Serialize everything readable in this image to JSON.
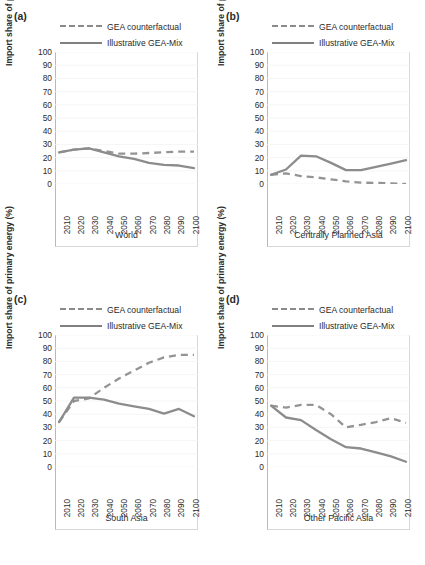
{
  "figure": {
    "ylabel": "Import share of primary energy (%)",
    "legend": {
      "counterfactual": "GEA counterfactual",
      "geamix": "Illustrative GEA-Mix"
    },
    "yticks": [
      "100",
      "90",
      "80",
      "70",
      "60",
      "50",
      "40",
      "30",
      "20",
      "10",
      "0"
    ],
    "xticks": [
      "2010",
      "2020",
      "2030",
      "2040",
      "2050",
      "2060",
      "2070",
      "2080",
      "2090",
      "2100"
    ]
  },
  "panels": [
    {
      "letter": "(a)",
      "caption": "World"
    },
    {
      "letter": "(b)",
      "caption": "Centrally Planned Asia"
    },
    {
      "letter": "(c)",
      "caption": "South Asia"
    },
    {
      "letter": "(d)",
      "caption": "Other Pacific Asia"
    }
  ],
  "chart_data": [
    {
      "type": "line",
      "title": "World",
      "panel": "(a)",
      "xlabel": "",
      "ylabel": "Import share of primary energy (%)",
      "x": [
        2010,
        2020,
        2030,
        2040,
        2050,
        2060,
        2070,
        2080,
        2090,
        2100
      ],
      "xlim": [
        2010,
        2100
      ],
      "ylim": [
        0,
        100
      ],
      "grid": true,
      "legend_position": "top",
      "series": [
        {
          "name": "GEA counterfactual",
          "style": "dashed",
          "color": "#949494",
          "values": [
            24,
            26,
            27,
            25,
            23,
            23,
            23.5,
            24,
            24.5,
            24.5
          ]
        },
        {
          "name": "Illustrative GEA-Mix",
          "style": "solid",
          "color": "#8c8c8c",
          "values": [
            24,
            26,
            27,
            24,
            21,
            19,
            16,
            14.5,
            14,
            12
          ]
        }
      ]
    },
    {
      "type": "line",
      "title": "Centrally Planned Asia",
      "panel": "(b)",
      "xlabel": "",
      "ylabel": "Import share of primary energy (%)",
      "x": [
        2010,
        2020,
        2030,
        2040,
        2050,
        2060,
        2070,
        2080,
        2090,
        2100
      ],
      "xlim": [
        2010,
        2100
      ],
      "ylim": [
        0,
        100
      ],
      "grid": true,
      "legend_position": "top",
      "series": [
        {
          "name": "GEA counterfactual",
          "style": "dashed",
          "color": "#949494",
          "values": [
            7,
            8,
            6,
            5,
            3.5,
            2,
            1,
            0.8,
            0.5,
            0
          ]
        },
        {
          "name": "Illustrative GEA-Mix",
          "style": "solid",
          "color": "#8c8c8c",
          "values": [
            7,
            11,
            21.5,
            21,
            16,
            10.5,
            10.5,
            13,
            15.5,
            18
          ]
        }
      ]
    },
    {
      "type": "line",
      "title": "South Asia",
      "panel": "(c)",
      "xlabel": "",
      "ylabel": "Import share of primary energy (%)",
      "x": [
        2010,
        2020,
        2030,
        2040,
        2050,
        2060,
        2070,
        2080,
        2090,
        2100
      ],
      "xlim": [
        2010,
        2100
      ],
      "ylim": [
        0,
        100
      ],
      "grid": true,
      "legend_position": "top",
      "series": [
        {
          "name": "GEA counterfactual",
          "style": "dashed",
          "color": "#949494",
          "values": [
            34,
            50,
            52,
            60,
            67,
            73,
            79,
            83,
            85,
            85
          ]
        },
        {
          "name": "Illustrative GEA-Mix",
          "style": "solid",
          "color": "#8c8c8c",
          "values": [
            34,
            52.5,
            52.5,
            51,
            48,
            46,
            44,
            40.5,
            44,
            38.5
          ]
        }
      ]
    },
    {
      "type": "line",
      "title": "Other Pacific Asia",
      "panel": "(d)",
      "xlabel": "",
      "ylabel": "Import share of primary energy (%)",
      "x": [
        2010,
        2020,
        2030,
        2040,
        2050,
        2060,
        2070,
        2080,
        2090,
        2100
      ],
      "xlim": [
        2010,
        2100
      ],
      "ylim": [
        0,
        100
      ],
      "grid": true,
      "legend_position": "top",
      "series": [
        {
          "name": "GEA counterfactual",
          "style": "dashed",
          "color": "#949494",
          "values": [
            46.5,
            45,
            47,
            47,
            40,
            30,
            32,
            34,
            37,
            33.5
          ]
        },
        {
          "name": "Illustrative GEA-Mix",
          "style": "solid",
          "color": "#8c8c8c",
          "values": [
            46.5,
            37.5,
            35.5,
            28,
            21,
            15,
            14,
            11,
            8,
            4
          ]
        }
      ]
    }
  ]
}
